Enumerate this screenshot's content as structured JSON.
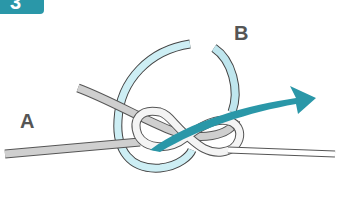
{
  "diagram": {
    "step_number": "3",
    "labels": {
      "a": "A",
      "b": "B"
    },
    "colors": {
      "badge": "#2a97a8",
      "rope_grey": "#c9c9c9",
      "rope_outline": "#555555",
      "rope_blue": "#bfe6ee",
      "arrow": "#2a97a8"
    }
  }
}
